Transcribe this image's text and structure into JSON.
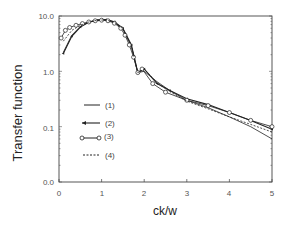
{
  "chart_data": {
    "type": "line",
    "title": "",
    "xlabel": "ck/w",
    "ylabel": "Transfer function",
    "xlim": [
      0,
      5
    ],
    "ylim": [
      0.01,
      10.0
    ],
    "yscale": "log",
    "grid": false,
    "legend_position": "inside lower-left",
    "x_ticks": [
      "0",
      "1",
      "2",
      "3",
      "4",
      "5"
    ],
    "y_ticks": [
      "0.0",
      "0.1",
      "1.0",
      "10.0"
    ],
    "series": [
      {
        "name": "(1)",
        "style": "solid",
        "x": [
          0.1,
          0.3,
          0.5,
          0.7,
          0.9,
          1.1,
          1.3,
          1.5,
          1.7,
          1.85,
          2.0,
          2.3,
          2.6,
          3.0,
          3.5,
          4.0,
          4.5,
          5.0
        ],
        "y": [
          2.2,
          4.5,
          6.5,
          7.8,
          8.5,
          8.6,
          7.8,
          5.8,
          2.8,
          0.95,
          1.0,
          0.65,
          0.45,
          0.3,
          0.22,
          0.15,
          0.1,
          0.06
        ]
      },
      {
        "name": "(2)",
        "style": "solid-with-arrow-markers",
        "x": [
          0.1,
          0.3,
          0.5,
          0.7,
          0.9,
          1.1,
          1.3,
          1.5,
          1.7,
          1.85,
          2.0,
          2.3,
          2.6,
          3.0,
          3.5,
          4.0,
          4.5,
          5.0
        ],
        "y": [
          2.1,
          4.3,
          6.3,
          7.7,
          8.4,
          8.6,
          7.9,
          6.0,
          3.0,
          0.95,
          1.1,
          0.6,
          0.45,
          0.32,
          0.25,
          0.18,
          0.13,
          0.09
        ]
      },
      {
        "name": "(3)",
        "style": "solid-with-circle-markers",
        "x": [
          0.05,
          0.15,
          0.25,
          0.4,
          0.55,
          0.7,
          0.85,
          1.0,
          1.15,
          1.3,
          1.45,
          1.55,
          1.65,
          1.75,
          1.85,
          1.95,
          2.2,
          2.5,
          3.0,
          3.5,
          4.0,
          4.5,
          5.0
        ],
        "y": [
          4.0,
          5.5,
          6.2,
          6.8,
          7.3,
          7.8,
          8.2,
          8.4,
          8.2,
          7.4,
          6.0,
          4.5,
          3.0,
          1.8,
          0.95,
          1.1,
          0.6,
          0.42,
          0.3,
          0.24,
          0.18,
          0.13,
          0.1
        ]
      },
      {
        "name": "(4)",
        "style": "dashed",
        "x": [
          0.1,
          0.3,
          0.5,
          0.7,
          0.9,
          1.1,
          1.3,
          1.5,
          1.7,
          1.85,
          2.0,
          2.3,
          2.6,
          3.0,
          3.5,
          4.0,
          4.5,
          5.0
        ],
        "y": [
          3.5,
          5.5,
          6.8,
          7.8,
          8.4,
          8.5,
          7.7,
          5.9,
          2.9,
          0.95,
          1.1,
          0.62,
          0.43,
          0.29,
          0.21,
          0.15,
          0.11,
          0.08
        ]
      }
    ]
  },
  "legend": {
    "items": [
      {
        "label": "(1)"
      },
      {
        "label": "(2)"
      },
      {
        "label": "(3)"
      },
      {
        "label": "(4)"
      }
    ]
  },
  "axes": {
    "xlabel": "ck/w",
    "ylabel": "Transfer function",
    "x_ticks": [
      "0",
      "1",
      "2",
      "3",
      "4",
      "5"
    ],
    "y_ticks": [
      "0.0",
      "0.1",
      "1.0",
      "10.0"
    ]
  },
  "colors": {
    "line": "#222222",
    "axis": "#444444",
    "text": "#555555"
  }
}
